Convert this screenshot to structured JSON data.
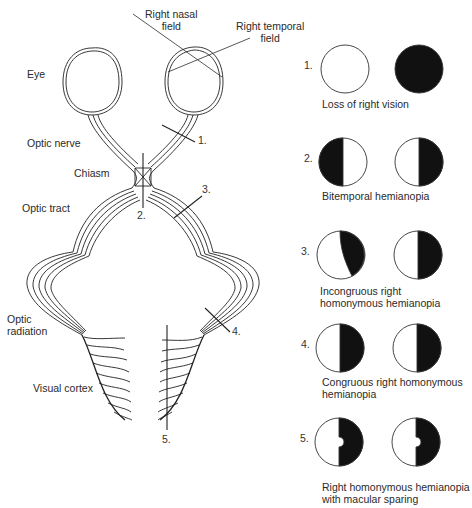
{
  "pathway_labels": {
    "right_nasal_field": [
      "Right nasal",
      "field"
    ],
    "right_temporal_field": [
      "Right temporal",
      "field"
    ],
    "eye": "Eye",
    "optic_nerve": "Optic nerve",
    "chiasm": "Chiasm",
    "optic_tract": "Optic tract",
    "optic_radiation": [
      "Optic",
      "radiation"
    ],
    "visual_cortex": "Visual cortex"
  },
  "lesion_markers": [
    "1.",
    "2.",
    "3.",
    "4.",
    "5."
  ],
  "field_defects": [
    {
      "number": "1.",
      "caption": [
        "Loss of right vision"
      ],
      "left_eye": "full",
      "right_eye": "blind"
    },
    {
      "number": "2.",
      "caption": [
        "Bitemporal hemianopia"
      ],
      "left_eye": "left-half-dark",
      "right_eye": "right-half-dark"
    },
    {
      "number": "3.",
      "caption": [
        "Incongruous right",
        "homonymous hemianopia"
      ],
      "left_eye": "right-partial-dark",
      "right_eye": "right-half-dark"
    },
    {
      "number": "4.",
      "caption": [
        "Congruous right homonymous",
        "hemianopia"
      ],
      "left_eye": "right-half-dark",
      "right_eye": "right-half-dark"
    },
    {
      "number": "5.",
      "caption": [
        "Right homonymous hemianopia",
        "with macular sparing"
      ],
      "left_eye": "right-half-dark-macula-spared",
      "right_eye": "right-half-dark-macula-spared"
    }
  ],
  "colors": {
    "ink": "#1a1a1a",
    "defect": "#111111"
  }
}
